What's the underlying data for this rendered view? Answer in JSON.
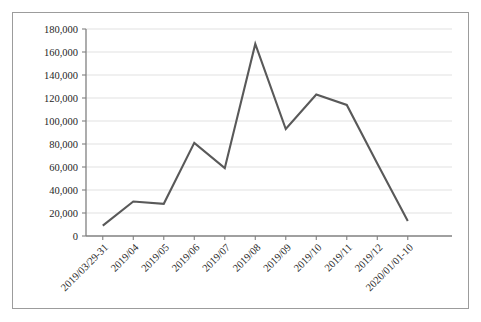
{
  "chart_data": {
    "type": "line",
    "title": "",
    "subtitle": "",
    "xlabel": "",
    "ylabel": "",
    "grid": true,
    "legend": false,
    "legend_position": "none",
    "ylim": [
      0,
      180000
    ],
    "ytick_labels": [
      "180,000",
      "160,000",
      "140,000",
      "120,000",
      "100,000",
      "80,000",
      "60,000",
      "40,000",
      "20,000",
      "0"
    ],
    "ytick_values": [
      180000,
      160000,
      140000,
      120000,
      100000,
      80000,
      60000,
      40000,
      20000,
      0
    ],
    "categories": [
      "2019/03/29-31",
      "2019/04",
      "2019/05",
      "2019/06",
      "2019/07",
      "2019/08",
      "2019/09",
      "2019/10",
      "2019/11",
      "2019/12",
      "2020/01/01-10"
    ],
    "values": [
      9000,
      30000,
      28000,
      81000,
      59000,
      167000,
      93000,
      123000,
      114000,
      63000,
      13000
    ],
    "series": [
      {
        "name": "series-1",
        "color": "#595959",
        "values": [
          9000,
          30000,
          28000,
          81000,
          59000,
          167000,
          93000,
          123000,
          114000,
          63000,
          13000
        ]
      }
    ]
  },
  "colors": {
    "line": "#595959",
    "gridline": "#d9d9d9",
    "axis": "#808080",
    "frame": "#9c9c9c",
    "text": "#262626",
    "background": "#ffffff"
  }
}
